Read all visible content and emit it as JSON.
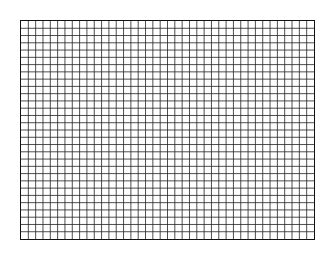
{
  "grid": {
    "columns": 40,
    "rows": 30,
    "line_color": "#222222",
    "border_color": "#111111",
    "background": "#ffffff"
  }
}
